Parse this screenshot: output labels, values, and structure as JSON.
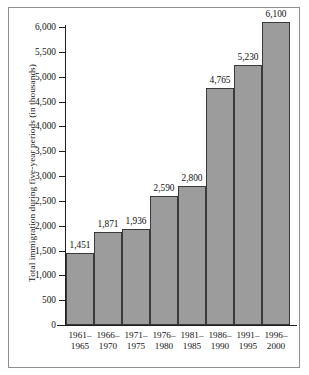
{
  "chart_data": {
    "type": "bar",
    "title": "",
    "xlabel": "",
    "ylabel": "Total immigration during five-year periods (in thousands)",
    "categories": [
      "1961–\n1965",
      "1966–\n1970",
      "1971–\n1975",
      "1976–\n1980",
      "1981–\n1985",
      "1986–\n1990",
      "1991–\n1995",
      "1996–\n2000"
    ],
    "category_lines": [
      [
        "1961–",
        "1965"
      ],
      [
        "1966–",
        "1970"
      ],
      [
        "1971–",
        "1975"
      ],
      [
        "1976–",
        "1980"
      ],
      [
        "1981–",
        "1985"
      ],
      [
        "1986–",
        "1990"
      ],
      [
        "1991–",
        "1995"
      ],
      [
        "1996–",
        "2000"
      ]
    ],
    "values": [
      1451,
      1871,
      1936,
      2590,
      2800,
      4765,
      5230,
      6100
    ],
    "value_labels": [
      "1,451",
      "1,871",
      "1,936",
      "2,590",
      "2,800",
      "4,765",
      "5,230",
      "6,100"
    ],
    "ylim": [
      0,
      6000
    ],
    "ytick_values": [
      0,
      500,
      1000,
      1500,
      2000,
      2500,
      3000,
      3500,
      4000,
      4500,
      5000,
      5500,
      6000
    ],
    "ytick_labels": [
      "0",
      "500",
      "1,000",
      "1,500",
      "2,000",
      "2,500",
      "3,000",
      "3,500",
      "4,000",
      "4,500",
      "5,000",
      "5,500",
      "6,000"
    ],
    "grid": false,
    "legend": null,
    "bar_color": "#9c9c9c",
    "bar_edge_color": "#3a3a3a",
    "axis_color": "#1f1f1f",
    "frame_color": "#8d8d8d",
    "background": "#ffffff"
  }
}
